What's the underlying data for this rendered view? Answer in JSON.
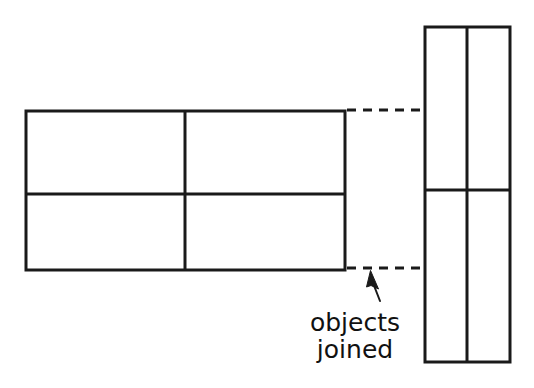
{
  "figure": {
    "title": "objects joined",
    "background_color": "#ffffff",
    "stroke_color": "#1a1a1a",
    "text_color": "#111111",
    "width": 534,
    "height": 388,
    "annotation": {
      "line1": "objects",
      "line2": "joined",
      "font_size_px": 25,
      "center_x": 355,
      "line1_baseline_y": 331,
      "line2_baseline_y": 358
    },
    "shapes": [
      {
        "name": "left-object",
        "type": "rectangle",
        "x": 26,
        "y": 111,
        "width": 319,
        "height": 159,
        "stroke_width": 3,
        "dividers": {
          "vertical_x": [
            185
          ],
          "horizontal_y": [
            194
          ]
        },
        "cells": 4
      },
      {
        "name": "right-object",
        "type": "rectangle",
        "x": 425,
        "y": 27,
        "width": 85,
        "height": 335,
        "stroke_width": 3,
        "dividers": {
          "vertical_x": [
            467
          ],
          "horizontal_y": [
            190
          ]
        },
        "cells": 4
      }
    ],
    "connectors": [
      {
        "name": "upper-join-line",
        "style": "dashed",
        "x1": 347,
        "y1": 110,
        "x2": 425,
        "y2": 110,
        "dash_pattern": "9 7",
        "stroke_width": 3
      },
      {
        "name": "lower-join-line",
        "style": "dashed",
        "x1": 347,
        "y1": 268,
        "x2": 425,
        "y2": 268,
        "dash_pattern": "9 7",
        "stroke_width": 3
      }
    ],
    "leader": {
      "name": "annotation-leader",
      "tail_x": 379,
      "tail_y": 300,
      "head_x": 370,
      "head_y": 271,
      "stroke_width": 2
    }
  }
}
